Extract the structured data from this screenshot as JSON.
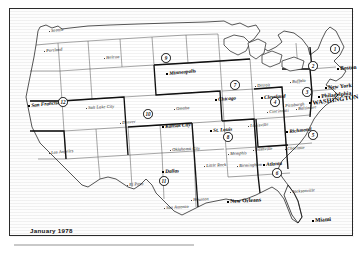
{
  "document": {
    "type": "map",
    "subject": "Federal Reserve Districts of the United States",
    "caption": "January 1978",
    "frame_color": "#2a2a2a",
    "background_color": "#ffffff"
  },
  "districts": [
    {
      "number": "1",
      "bank": "Boston",
      "x": 325,
      "y": 40
    },
    {
      "number": "2",
      "bank": "New York",
      "x": 303,
      "y": 57
    },
    {
      "number": "3",
      "bank": "Philadelphia",
      "x": 297,
      "y": 83
    },
    {
      "number": "4",
      "bank": "Cleveland",
      "x": 265,
      "y": 93
    },
    {
      "number": "5",
      "bank": "Richmond",
      "x": 303,
      "y": 126
    },
    {
      "number": "6",
      "bank": "Atlanta",
      "x": 267,
      "y": 164
    },
    {
      "number": "7",
      "bank": "Chicago",
      "x": 225,
      "y": 76
    },
    {
      "number": "8",
      "bank": "St. Louis",
      "x": 218,
      "y": 128
    },
    {
      "number": "9",
      "bank": "Minneapolis",
      "x": 156,
      "y": 49
    },
    {
      "number": "10",
      "bank": "Kansas City",
      "x": 138,
      "y": 105
    },
    {
      "number": "11",
      "bank": "Dallas",
      "x": 154,
      "y": 172
    },
    {
      "number": "12",
      "bank": "San Francisco",
      "x": 53,
      "y": 93
    }
  ],
  "reserve_bank_cities": [
    {
      "name": "Minneapolis",
      "x": 159,
      "y": 62,
      "rot": -6
    },
    {
      "name": "Chicago",
      "x": 208,
      "y": 88,
      "rot": -5
    },
    {
      "name": "Kansas City",
      "x": 155,
      "y": 115,
      "rot": -4
    },
    {
      "name": "St. Louis",
      "x": 203,
      "y": 119,
      "rot": -4
    },
    {
      "name": "Dallas",
      "x": 155,
      "y": 160,
      "rot": -3
    },
    {
      "name": "Atlanta",
      "x": 256,
      "y": 153,
      "rot": -4
    },
    {
      "name": "Richmond",
      "x": 279,
      "y": 120,
      "rot": -6
    },
    {
      "name": "Cleveland",
      "x": 254,
      "y": 86,
      "rot": -4
    },
    {
      "name": "San Francisco",
      "x": 21,
      "y": 94,
      "rot": -6
    }
  ],
  "capital_city": {
    "name": "WASHINGTON",
    "x": 302,
    "y": 91,
    "rot": -8
  },
  "major_cities": [
    {
      "name": "Boston",
      "x": 330,
      "y": 57,
      "rot": -4
    },
    {
      "name": "New York",
      "x": 318,
      "y": 76,
      "rot": -5
    },
    {
      "name": "Philadelphia",
      "x": 311,
      "y": 85,
      "rot": -6
    },
    {
      "name": "New Orleans",
      "x": 220,
      "y": 190,
      "rot": -3
    },
    {
      "name": "Miami",
      "x": 305,
      "y": 209,
      "rot": -4
    }
  ],
  "cities": [
    {
      "name": "Seattle",
      "x": 41,
      "y": 20,
      "rot": -6
    },
    {
      "name": "Portland",
      "x": 36,
      "y": 40,
      "rot": -5
    },
    {
      "name": "Helena",
      "x": 96,
      "y": 47,
      "rot": -4
    },
    {
      "name": "Salt Lake City",
      "x": 78,
      "y": 97,
      "rot": -3
    },
    {
      "name": "Denver",
      "x": 112,
      "y": 112,
      "rot": -5
    },
    {
      "name": "Los Angeles",
      "x": 41,
      "y": 142,
      "rot": -5
    },
    {
      "name": "Omaha",
      "x": 166,
      "y": 98,
      "rot": -4
    },
    {
      "name": "Oklahoma City",
      "x": 162,
      "y": 139,
      "rot": -3
    },
    {
      "name": "Little Rock",
      "x": 196,
      "y": 155,
      "rot": -3
    },
    {
      "name": "El Paso",
      "x": 119,
      "y": 174,
      "rot": -4
    },
    {
      "name": "San Antonio",
      "x": 156,
      "y": 197,
      "rot": -3
    },
    {
      "name": "Houston",
      "x": 183,
      "y": 189,
      "rot": -3
    },
    {
      "name": "Memphis",
      "x": 220,
      "y": 143,
      "rot": -3
    },
    {
      "name": "Nashville",
      "x": 245,
      "y": 139,
      "rot": -4
    },
    {
      "name": "Birmingham",
      "x": 229,
      "y": 155,
      "rot": -3
    },
    {
      "name": "Louisville",
      "x": 240,
      "y": 115,
      "rot": -4
    },
    {
      "name": "Cincinnati",
      "x": 259,
      "y": 101,
      "rot": -4
    },
    {
      "name": "Pittsburgh",
      "x": 275,
      "y": 95,
      "rot": -5
    },
    {
      "name": "Baltimore",
      "x": 288,
      "y": 98,
      "rot": -5
    },
    {
      "name": "Buffalo",
      "x": 282,
      "y": 71,
      "rot": -5
    },
    {
      "name": "Detroit",
      "x": 247,
      "y": 75,
      "rot": -4
    },
    {
      "name": "Charlotte",
      "x": 277,
      "y": 138,
      "rot": -4
    },
    {
      "name": "Jacksonville",
      "x": 282,
      "y": 181,
      "rot": -4
    }
  ]
}
